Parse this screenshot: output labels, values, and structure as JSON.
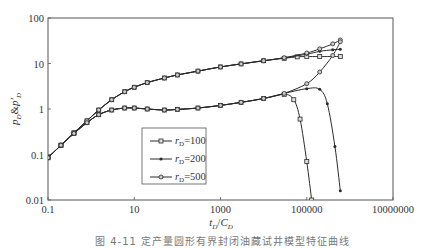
{
  "chart_data": {
    "type": "line",
    "title": "",
    "xlabel": "tD/CD",
    "ylabel": "pD&p'D",
    "xscale": "log",
    "yscale": "log",
    "xlim": [
      0.1,
      10000000
    ],
    "ylim": [
      0.01,
      100
    ],
    "x_ticks": [
      "0.1",
      "10",
      "1000",
      "100000",
      "10000000"
    ],
    "y_ticks": [
      "100",
      "10",
      "1",
      "0.1",
      "0.01"
    ],
    "grid": false,
    "legend_position": "lower-center-left",
    "legend": [
      "rD=100",
      "rD=200",
      "rD=500"
    ],
    "series": [
      {
        "name": "rD=100",
        "marker": "square-open",
        "pressure": {
          "x": [
            0.1,
            0.2,
            0.4,
            0.8,
            1.5,
            3,
            6,
            10,
            20,
            50,
            100,
            300,
            1000,
            3000,
            10000,
            30000,
            60000,
            100000,
            200000,
            600000
          ],
          "y": [
            0.085,
            0.16,
            0.3,
            0.55,
            0.95,
            1.6,
            2.4,
            3.0,
            3.8,
            4.8,
            5.6,
            6.8,
            8.4,
            9.8,
            11.5,
            13.0,
            14.0,
            14.2,
            14.2,
            14.2
          ]
        },
        "derivative": {
          "x": [
            0.1,
            0.2,
            0.4,
            0.8,
            1.5,
            3,
            6,
            10,
            20,
            50,
            100,
            300,
            1000,
            3000,
            10000,
            30000,
            50000,
            70000,
            100000,
            130000
          ],
          "y": [
            0.085,
            0.16,
            0.29,
            0.5,
            0.75,
            0.95,
            1.05,
            1.05,
            1.0,
            0.95,
            0.98,
            1.05,
            1.2,
            1.4,
            1.7,
            2.1,
            1.6,
            0.6,
            0.07,
            0.01
          ]
        }
      },
      {
        "name": "rD=200",
        "marker": "plus-dot",
        "pressure": {
          "x": [
            0.1,
            0.2,
            0.4,
            0.8,
            1.5,
            3,
            6,
            10,
            20,
            50,
            100,
            300,
            1000,
            3000,
            10000,
            30000,
            100000,
            200000,
            400000,
            600000
          ],
          "y": [
            0.085,
            0.16,
            0.3,
            0.55,
            0.95,
            1.6,
            2.4,
            3.0,
            3.8,
            4.8,
            5.6,
            6.8,
            8.4,
            9.8,
            11.5,
            13.3,
            16.0,
            18.5,
            20.0,
            20.5
          ]
        },
        "derivative": {
          "x": [
            0.1,
            0.2,
            0.4,
            0.8,
            1.5,
            3,
            6,
            10,
            20,
            50,
            100,
            300,
            1000,
            3000,
            10000,
            30000,
            100000,
            200000,
            300000,
            450000,
            600000
          ],
          "y": [
            0.085,
            0.16,
            0.29,
            0.5,
            0.75,
            0.95,
            1.05,
            1.05,
            1.0,
            0.95,
            0.98,
            1.05,
            1.2,
            1.4,
            1.7,
            2.2,
            2.8,
            2.7,
            1.3,
            0.15,
            0.016
          ]
        }
      },
      {
        "name": "rD=500",
        "marker": "circle-open",
        "pressure": {
          "x": [
            0.1,
            0.2,
            0.4,
            0.8,
            1.5,
            3,
            6,
            10,
            20,
            50,
            100,
            300,
            1000,
            3000,
            10000,
            30000,
            100000,
            200000,
            400000,
            600000
          ],
          "y": [
            0.085,
            0.16,
            0.3,
            0.55,
            0.95,
            1.6,
            2.4,
            3.0,
            3.8,
            4.8,
            5.6,
            6.8,
            8.4,
            9.8,
            11.5,
            13.4,
            17.0,
            21.0,
            27.0,
            33.0
          ]
        },
        "derivative": {
          "x": [
            0.1,
            0.2,
            0.4,
            0.8,
            1.5,
            3,
            6,
            10,
            20,
            50,
            100,
            300,
            1000,
            3000,
            10000,
            30000,
            100000,
            200000,
            400000,
            600000
          ],
          "y": [
            0.085,
            0.16,
            0.29,
            0.5,
            0.75,
            0.95,
            1.05,
            1.05,
            1.0,
            0.95,
            0.98,
            1.05,
            1.2,
            1.4,
            1.7,
            2.2,
            3.6,
            6.5,
            15.0,
            30.0
          ]
        }
      }
    ]
  },
  "axes": {
    "xlabel_main": "t",
    "xlabel_sub1": "D",
    "xlabel_sep": "/",
    "xlabel_main2": "C",
    "xlabel_sub2": "D",
    "ylabel_main": "p",
    "ylabel_sub": "D",
    "ylabel_amp": "&",
    "ylabel_main2": "p'",
    "ylabel_sub2": "D"
  },
  "legend": {
    "items": [
      {
        "prefix": "r",
        "sub": "D",
        "suffix": "=100"
      },
      {
        "prefix": "r",
        "sub": "D",
        "suffix": "=200"
      },
      {
        "prefix": "r",
        "sub": "D",
        "suffix": "=500"
      }
    ]
  },
  "caption": "图 4-11  定产量圆形有界封闭油藏试井模型特征曲线",
  "colors": {
    "line": "#2a2a2a",
    "axis": "#555555"
  }
}
